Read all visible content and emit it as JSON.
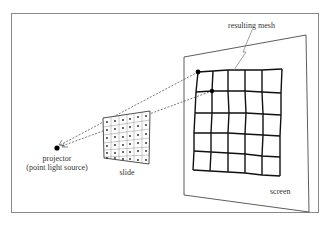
{
  "diagram": {
    "labels": {
      "resulting_mesh": "resulting mesh",
      "projector_line1": "projector",
      "projector_line2": "(point light source)",
      "slide": "slide",
      "screen": "screen"
    },
    "colors": {
      "stroke": "#111111",
      "frame": "#888888",
      "text": "#333333",
      "ray": "#555555"
    },
    "slide_grid": {
      "rows": 6,
      "cols": 6
    },
    "mesh_grid": {
      "rows": 5,
      "cols": 5
    }
  }
}
